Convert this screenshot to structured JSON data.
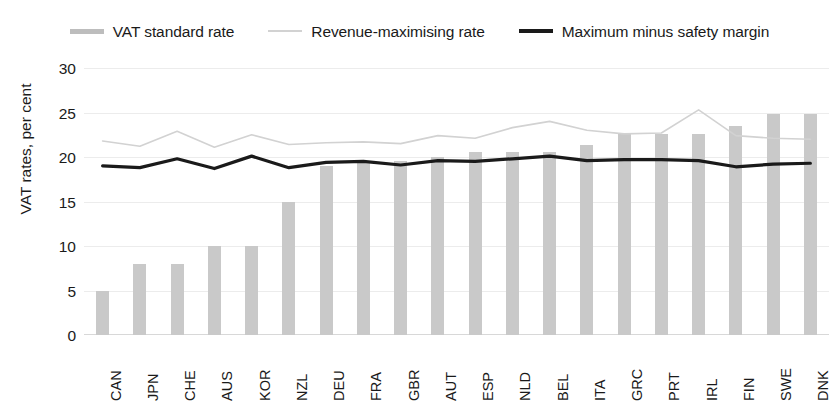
{
  "legend": {
    "items": [
      {
        "label": "VAT standard rate",
        "style": "bar",
        "color": "#bdbdbd"
      },
      {
        "label": "Revenue-maximising rate",
        "style": "thin-line",
        "color": "#d2d2d2"
      },
      {
        "label": "Maximum minus safety margin",
        "style": "thick-line",
        "color": "#1a1a1a"
      }
    ]
  },
  "axes": {
    "ylabel": "VAT rates, per cent",
    "yticks": [
      "30",
      "25",
      "20",
      "15",
      "10",
      "5",
      "0"
    ],
    "ymin": 0,
    "ymax": 30
  },
  "chart_data": {
    "type": "bar",
    "title": "",
    "xlabel": "",
    "ylabel": "VAT rates, per cent",
    "ylim": [
      0,
      30
    ],
    "yticks": [
      0,
      5,
      10,
      15,
      20,
      25,
      30
    ],
    "grid": true,
    "legend_position": "top-center",
    "categories": [
      "CAN",
      "JPN",
      "CHE",
      "AUS",
      "KOR",
      "NZL",
      "DEU",
      "FRA",
      "GBR",
      "AUT",
      "ESP",
      "NLD",
      "BEL",
      "ITA",
      "GRC",
      "PRT",
      "IRL",
      "FIN",
      "SWE",
      "DNK"
    ],
    "series": [
      {
        "name": "VAT standard rate",
        "type": "bar",
        "color": "#c9c9c9",
        "values": [
          5,
          8,
          8,
          10,
          10,
          15,
          19,
          19.6,
          19.5,
          20,
          20.6,
          20.6,
          20.6,
          21.4,
          22.6,
          22.6,
          22.6,
          23.5,
          24.8,
          24.8
        ]
      },
      {
        "name": "Revenue-maximising rate",
        "type": "line",
        "color": "#d2d2d2",
        "values": [
          21.8,
          21.2,
          22.9,
          21.1,
          22.5,
          21.4,
          21.6,
          21.7,
          21.5,
          22.4,
          22.1,
          23.3,
          24.0,
          23.0,
          22.6,
          22.7,
          25.3,
          22.4,
          22.1,
          22.0
        ]
      },
      {
        "name": "Maximum minus safety margin",
        "type": "line",
        "color": "#1a1a1a",
        "values": [
          19.0,
          18.8,
          19.8,
          18.7,
          20.1,
          18.8,
          19.4,
          19.5,
          19.1,
          19.6,
          19.5,
          19.8,
          20.1,
          19.6,
          19.7,
          19.7,
          19.6,
          18.9,
          19.2,
          19.3
        ]
      }
    ]
  }
}
